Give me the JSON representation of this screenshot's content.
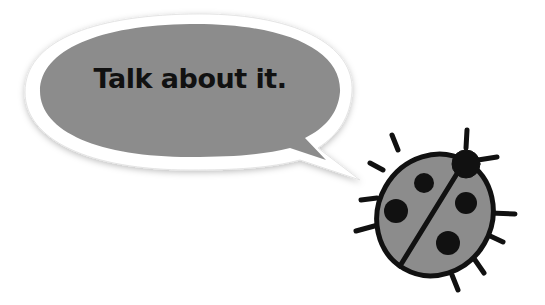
{
  "speech_bubble": {
    "text": "Talk about it.",
    "fill_color": "#8c8c8c",
    "border_color": "#ffffff"
  },
  "ladybug": {
    "body_color": "#8c8c8c",
    "outline_color": "#111111",
    "spots": 4
  }
}
